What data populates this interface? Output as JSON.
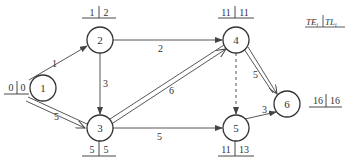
{
  "legend": {
    "te": "TE",
    "te_sub": "i",
    "tl": "TL",
    "tl_sub": "i"
  },
  "nodes": [
    {
      "id": "1",
      "te": "0",
      "tl": "0"
    },
    {
      "id": "2",
      "te": "1",
      "tl": "2"
    },
    {
      "id": "3",
      "te": "5",
      "tl": "5"
    },
    {
      "id": "4",
      "te": "11",
      "tl": "11"
    },
    {
      "id": "5",
      "te": "11",
      "tl": "13"
    },
    {
      "id": "6",
      "te": "16",
      "tl": "16"
    }
  ],
  "edges": [
    {
      "from": "1",
      "to": "2",
      "duration": "1",
      "critical": false,
      "dummy": false
    },
    {
      "from": "1",
      "to": "3",
      "duration": "5",
      "critical": true,
      "dummy": false
    },
    {
      "from": "2",
      "to": "3",
      "duration": "3",
      "critical": false,
      "dummy": false
    },
    {
      "from": "2",
      "to": "4",
      "duration": "2",
      "critical": false,
      "dummy": false
    },
    {
      "from": "3",
      "to": "4",
      "duration": "6",
      "critical": true,
      "dummy": false
    },
    {
      "from": "3",
      "to": "5",
      "duration": "5",
      "critical": false,
      "dummy": false
    },
    {
      "from": "4",
      "to": "5",
      "duration": "",
      "critical": false,
      "dummy": true
    },
    {
      "from": "4",
      "to": "6",
      "duration": "5",
      "critical": true,
      "dummy": false
    },
    {
      "from": "5",
      "to": "6",
      "duration": "3",
      "critical": false,
      "dummy": false
    }
  ]
}
